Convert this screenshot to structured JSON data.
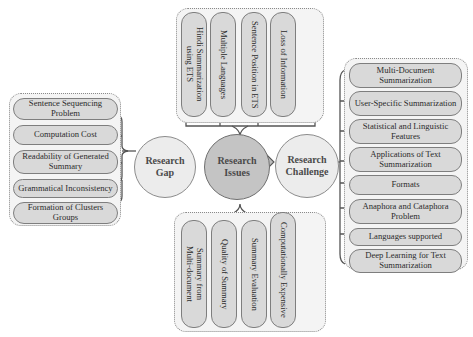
{
  "diagram": {
    "center": {
      "label": "Research\nIssues"
    },
    "left_node": {
      "label": "Research\nGap"
    },
    "right_node": {
      "label": "Research\nChallenge"
    },
    "research_gap_items": [
      "Sentence Sequencing Problem",
      "Computation Cost",
      "Readability of Generated Summary",
      "Grammatical Inconsistency",
      "Formation of Clusters Groups"
    ],
    "research_issues_top_items": [
      "Hindi Summarization\nusing ETS",
      "Multiple Languages",
      "Sentence Position in ETS",
      "Loss of Information"
    ],
    "research_issues_bottom_items": [
      "Summary from\nMulti-document",
      "Quality of Summary",
      "Summary Evaluation",
      "Computationally Expensive"
    ],
    "research_challenge_items": [
      "Multi-Document Summarization",
      "User-Specific Summarization",
      "Statistical and Linguistic Features",
      "Applications of Text Summarization",
      "Formats",
      "Anaphora and Cataphora Problem",
      "Languages supported",
      "Deep Learning for Text Summarization"
    ],
    "colors": {
      "pill_fill": "#d9d9d9",
      "center_fill": "#c4c4c4",
      "side_fill": "#ececec",
      "cluster_fill": "#f4f4f4",
      "line": "#555555"
    }
  }
}
